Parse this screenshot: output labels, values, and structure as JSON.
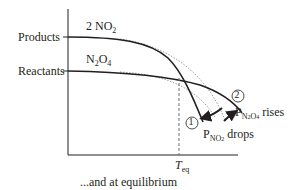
{
  "diagram": {
    "y_axis_labels": {
      "products": "Products",
      "reactants": "Reactants"
    },
    "curve_labels": {
      "products": {
        "coef": "2 NO",
        "sub": "2"
      },
      "reactants": {
        "a": "N",
        "sub1": "2",
        "b": "O",
        "sub2": "4"
      }
    },
    "markers": {
      "one": "1",
      "two": "2"
    },
    "annotations": {
      "p_no2": {
        "p": "P",
        "sub": "NO",
        "subsub": "2",
        "text": " drops"
      },
      "p_n2o4": {
        "p": "P",
        "sub": "N",
        "sub2a": "2",
        "sub_o": "O",
        "sub2b": "4",
        "text": " rises"
      }
    },
    "x_tick": {
      "t": "T",
      "sub": "eq"
    },
    "caption": "...and at equilibrium",
    "colors": {
      "line": "#231f20",
      "dotted": "#9d9d9d",
      "dashed": "#6d6e71"
    }
  }
}
